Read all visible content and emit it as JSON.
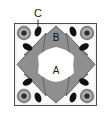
{
  "figure": {
    "background_color": "#ffffff",
    "frame": {
      "name": "unit-cell-square",
      "stroke_color": "#4d4d4d",
      "fill_color": "#f2f2f2",
      "x": 14,
      "y": 23,
      "width": 83,
      "height": 83
    },
    "labels": [
      {
        "id": "A",
        "text": "A",
        "x": 55,
        "y": 71,
        "meaning": "central white region"
      },
      {
        "id": "B",
        "text": "B",
        "x": 56,
        "y": 38,
        "meaning": "upper gray petal region"
      },
      {
        "id": "C",
        "text": "C",
        "x": 38,
        "y": 17,
        "meaning": "black elliptical inclusion"
      }
    ],
    "leader_line": {
      "name": "callout-leader-c",
      "x1": 38,
      "y1": 19,
      "x2": 38,
      "y2": 30,
      "stroke_color": "#1a1a1a"
    },
    "petals": {
      "name": "gray-petal-set",
      "count": 4,
      "fill_color": "#8f8f8f",
      "stroke_color": "#5a5a5a",
      "orientations": [
        "top",
        "right",
        "bottom",
        "left"
      ]
    },
    "center_region": {
      "name": "region-a",
      "fill_color": "#ffffff",
      "label": "A"
    },
    "corner_rings": {
      "name": "concentric-ring-set",
      "count": 4,
      "outer_color": "#777777",
      "mid_color": "#a8a8a8",
      "core_color": "#2b2b2b",
      "positions": [
        "top-left",
        "top-right",
        "bottom-left",
        "bottom-right"
      ]
    },
    "ellipses": {
      "name": "black-ellipse-set",
      "count": 8,
      "fill_color": "#111111"
    }
  }
}
